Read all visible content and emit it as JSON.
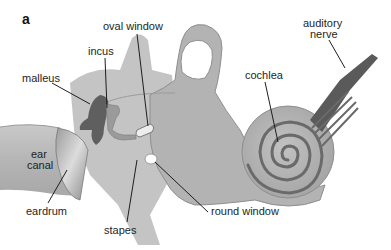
{
  "figure": {
    "panel_letter": "a",
    "colors": {
      "background": "#ffffff",
      "tissue": "#b8b8b8",
      "tissue_light": "#cfcfcf",
      "tissue_dark": "#8e8e8e",
      "malleus": "#5f5f5f",
      "incus": "#9a9a9a",
      "cochlea_spiral": "#6a6a6a",
      "nerve": "#5a5a5a",
      "leader_line": "#1e1e1e"
    },
    "labels": {
      "oval_window": "oval window",
      "incus": "incus",
      "malleus": "malleus",
      "auditory_nerve_line1": "auditory",
      "auditory_nerve_line2": "nerve",
      "cochlea": "cochlea",
      "ear_canal_line1": "ear",
      "ear_canal_line2": "canal",
      "eardrum": "eardrum",
      "stapes": "stapes",
      "round_window": "round window"
    }
  }
}
